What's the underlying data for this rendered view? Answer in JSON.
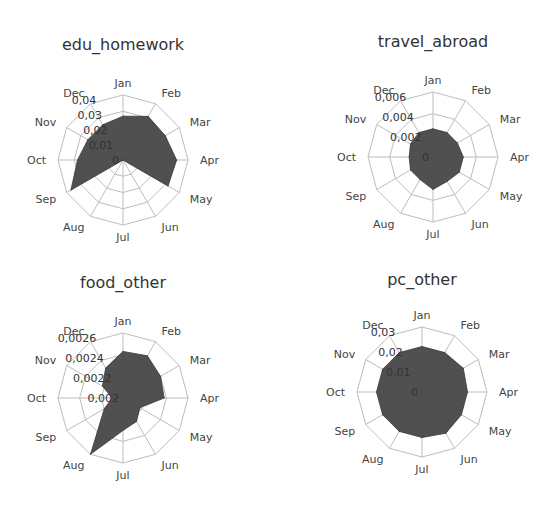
{
  "chart_data": [
    {
      "type": "radar",
      "title": "edu_homework",
      "categories": [
        "Jan",
        "Feb",
        "Mar",
        "Apr",
        "May",
        "Jun",
        "Jul",
        "Aug",
        "Sep",
        "Oct",
        "Nov",
        "Dec"
      ],
      "values": [
        0.027,
        0.031,
        0.03,
        0.033,
        0.032,
        0.0,
        0.0,
        0.0,
        0.037,
        0.028,
        0.025,
        0.025
      ],
      "range": [
        0,
        0.04
      ],
      "ticks": [
        "0",
        "0,01",
        "0,02",
        "0,03",
        "0,04"
      ],
      "tick_values": [
        0,
        0.01,
        0.02,
        0.03,
        0.04
      ],
      "grid": true,
      "legend": "none"
    },
    {
      "type": "radar",
      "title": "travel_abroad",
      "categories": [
        "Jan",
        "Feb",
        "Mar",
        "Apr",
        "May",
        "Jun",
        "Jul",
        "Aug",
        "Sep",
        "Oct",
        "Nov",
        "Dec"
      ],
      "values": [
        0.0026,
        0.0026,
        0.0026,
        0.0028,
        0.0028,
        0.0026,
        0.003,
        0.0024,
        0.0024,
        0.0022,
        0.0024,
        0.0026
      ],
      "range": [
        0,
        0.006
      ],
      "ticks": [
        "0",
        "0,002",
        "0,004",
        "0,006"
      ],
      "tick_values": [
        0,
        0.002,
        0.004,
        0.006
      ],
      "grid": true,
      "legend": "none"
    },
    {
      "type": "radar",
      "title": "food_other",
      "categories": [
        "Jan",
        "Feb",
        "Mar",
        "Apr",
        "May",
        "Jun",
        "Jul",
        "Aug",
        "Sep",
        "Oct",
        "Nov",
        "Dec"
      ],
      "values": [
        0.00243,
        0.00245,
        0.0024,
        0.00238,
        0.00218,
        0.00225,
        0.0023,
        0.0026,
        0.0022,
        0.0021,
        0.00222,
        0.00232
      ],
      "range": [
        0.002,
        0.0026
      ],
      "ticks": [
        "0,002",
        "0,0022",
        "0,0024",
        "0,0026"
      ],
      "tick_values": [
        0.002,
        0.0022,
        0.0024,
        0.0026
      ],
      "grid": true,
      "legend": "none"
    },
    {
      "type": "radar",
      "title": "pc_other",
      "categories": [
        "Jan",
        "Feb",
        "Mar",
        "Apr",
        "May",
        "Jun",
        "Jul",
        "Aug",
        "Sep",
        "Oct",
        "Nov",
        "Dec"
      ],
      "values": [
        0.021,
        0.021,
        0.022,
        0.021,
        0.021,
        0.022,
        0.021,
        0.021,
        0.021,
        0.021,
        0.021,
        0.021
      ],
      "range": [
        0,
        0.03
      ],
      "ticks": [
        "0",
        "0,01",
        "0,02",
        "0,03"
      ],
      "tick_values": [
        0,
        0.01,
        0.02,
        0.03
      ],
      "grid": true,
      "legend": "none"
    }
  ]
}
